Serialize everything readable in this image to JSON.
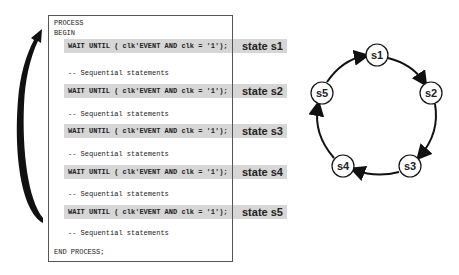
{
  "code": {
    "process": "PROCESS",
    "begin": "BEGIN",
    "blocks": [
      {
        "wait": "WAIT UNTIL ( clk'EVENT AND clk = '1');",
        "state": "state s1",
        "comment": "-- Sequential statements"
      },
      {
        "wait": "WAIT UNTIL ( clk'EVENT AND clk = '1');",
        "state": "state s2",
        "comment": "-- Sequential statements"
      },
      {
        "wait": "WAIT UNTIL ( clk'EVENT AND clk = '1');",
        "state": "state s3",
        "comment": "-- Sequential statements"
      },
      {
        "wait": "WAIT UNTIL ( clk'EVENT AND clk = '1');",
        "state": "state s4",
        "comment": "-- Sequential statements"
      },
      {
        "wait": "WAIT UNTIL ( clk'EVENT AND clk = '1');",
        "state": "state s5",
        "comment": "-- Sequential statements"
      }
    ],
    "end": "END PROCESS;"
  },
  "diagram": {
    "nodes": [
      "s1",
      "s2",
      "s3",
      "s4",
      "s5"
    ],
    "edges": [
      [
        "s1",
        "s2"
      ],
      [
        "s2",
        "s3"
      ],
      [
        "s3",
        "s4"
      ],
      [
        "s4",
        "s5"
      ],
      [
        "s5",
        "s1"
      ]
    ]
  },
  "colors": {
    "bar": "#d6d6d6",
    "line": "#111111"
  }
}
